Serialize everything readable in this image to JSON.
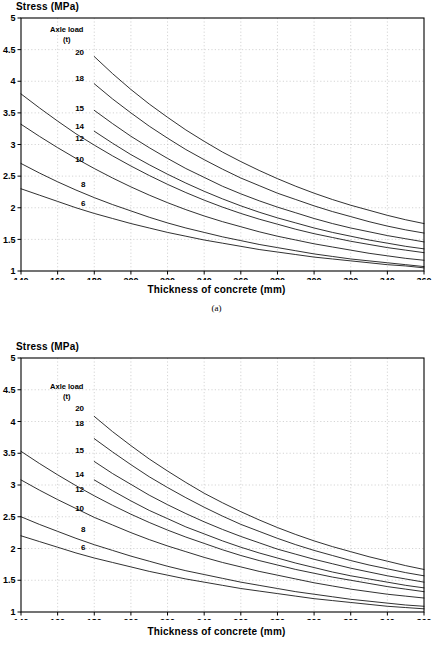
{
  "figures": [
    {
      "id": "a",
      "panel_label": "(a)",
      "y_axis_title": "Stress  (MPa)",
      "x_axis_title": "Thickness of concrete (mm)",
      "legend_title_line1": "Axle load",
      "legend_title_line2": "(t)",
      "chart_data": {
        "type": "line",
        "title": "",
        "xlabel": "Thickness of concrete (mm)",
        "ylabel": "Stress  (MPa)",
        "xlim": [
          140,
          360
        ],
        "ylim": [
          1,
          5
        ],
        "xticks": [
          140,
          160,
          180,
          200,
          220,
          240,
          260,
          280,
          300,
          320,
          340,
          360
        ],
        "yticks": [
          1,
          1.5,
          2,
          2.5,
          3,
          3.5,
          4,
          4.5,
          5
        ],
        "grid": true,
        "legend_position": "inside-upper-left",
        "legend_title": "Axle load (t)",
        "series": [
          {
            "name": "20",
            "label": "20",
            "label_x": 172,
            "label_y": 4.47,
            "x": [
              180,
              190,
              200,
              210,
              220,
              230,
              240,
              250,
              260,
              270,
              280,
              290,
              300,
              310,
              320,
              330,
              340,
              350,
              360
            ],
            "values": [
              4.39,
              4.12,
              3.87,
              3.64,
              3.43,
              3.23,
              3.05,
              2.88,
              2.73,
              2.59,
              2.46,
              2.34,
              2.23,
              2.13,
              2.04,
              1.96,
              1.88,
              1.81,
              1.75
            ]
          },
          {
            "name": "18",
            "label": "18",
            "label_x": 172,
            "label_y": 4.05,
            "x": [
              180,
              190,
              200,
              210,
              220,
              230,
              240,
              250,
              260,
              270,
              280,
              290,
              300,
              310,
              320,
              330,
              340,
              350,
              360
            ],
            "values": [
              3.96,
              3.72,
              3.5,
              3.29,
              3.1,
              2.92,
              2.76,
              2.61,
              2.47,
              2.35,
              2.23,
              2.13,
              2.03,
              1.94,
              1.86,
              1.78,
              1.71,
              1.65,
              1.6
            ]
          },
          {
            "name": "15",
            "label": "15",
            "label_x": 172,
            "label_y": 3.58,
            "x": [
              180,
              190,
              200,
              210,
              220,
              230,
              240,
              250,
              260,
              270,
              280,
              290,
              300,
              310,
              320,
              330,
              340,
              350,
              360
            ],
            "values": [
              3.54,
              3.33,
              3.13,
              2.95,
              2.78,
              2.62,
              2.48,
              2.34,
              2.22,
              2.11,
              2.01,
              1.92,
              1.83,
              1.75,
              1.68,
              1.62,
              1.56,
              1.51,
              1.46
            ]
          },
          {
            "name": "14",
            "label": "14",
            "label_x": 172,
            "label_y": 3.3,
            "x": [
              180,
              190,
              200,
              210,
              220,
              230,
              240,
              250,
              260,
              270,
              280,
              290,
              300,
              310,
              320,
              330,
              340,
              350,
              360
            ],
            "values": [
              3.21,
              3.02,
              2.84,
              2.68,
              2.53,
              2.39,
              2.26,
              2.14,
              2.03,
              1.93,
              1.84,
              1.76,
              1.68,
              1.61,
              1.55,
              1.49,
              1.44,
              1.39,
              1.35
            ]
          },
          {
            "name": "12",
            "label": "12",
            "label_x": 172,
            "label_y": 3.1,
            "x": [
              140,
              150,
              160,
              170,
              180,
              190,
              200,
              210,
              220,
              230,
              240,
              250,
              260,
              270,
              280,
              290,
              300,
              310,
              320,
              330,
              340,
              350,
              360
            ],
            "values": [
              3.8,
              3.58,
              3.37,
              3.17,
              2.99,
              2.82,
              2.66,
              2.51,
              2.37,
              2.24,
              2.12,
              2.01,
              1.91,
              1.82,
              1.74,
              1.66,
              1.59,
              1.53,
              1.47,
              1.42,
              1.37,
              1.33,
              1.29
            ]
          },
          {
            "name": "10",
            "label": "10",
            "label_x": 172,
            "label_y": 2.77,
            "x": [
              140,
              150,
              160,
              170,
              180,
              190,
              200,
              210,
              220,
              230,
              240,
              250,
              260,
              270,
              280,
              290,
              300,
              310,
              320,
              330,
              340,
              350,
              360
            ],
            "values": [
              3.32,
              3.13,
              2.95,
              2.78,
              2.62,
              2.47,
              2.33,
              2.2,
              2.08,
              1.97,
              1.87,
              1.78,
              1.7,
              1.62,
              1.55,
              1.49,
              1.43,
              1.38,
              1.33,
              1.28,
              1.24,
              1.2,
              1.17
            ]
          },
          {
            "name": "8",
            "label": "8",
            "label_x": 174,
            "label_y": 2.38,
            "x": [
              140,
              150,
              160,
              170,
              180,
              190,
              200,
              210,
              220,
              230,
              240,
              250,
              260,
              270,
              280,
              290,
              300,
              310,
              320,
              330,
              340,
              350,
              360
            ],
            "values": [
              2.7,
              2.55,
              2.41,
              2.28,
              2.16,
              2.05,
              1.95,
              1.85,
              1.76,
              1.68,
              1.61,
              1.54,
              1.48,
              1.42,
              1.37,
              1.32,
              1.27,
              1.23,
              1.19,
              1.16,
              1.13,
              1.1,
              1.07
            ]
          },
          {
            "name": "6",
            "label": "6",
            "label_x": 174,
            "label_y": 2.07,
            "x": [
              140,
              150,
              160,
              170,
              180,
              190,
              200,
              210,
              220,
              230,
              240,
              250,
              260,
              270,
              280,
              290,
              300,
              310,
              320,
              330,
              340,
              350,
              360
            ],
            "values": [
              2.3,
              2.2,
              2.1,
              2.0,
              1.91,
              1.83,
              1.75,
              1.68,
              1.61,
              1.55,
              1.49,
              1.44,
              1.39,
              1.34,
              1.3,
              1.26,
              1.22,
              1.19,
              1.16,
              1.13,
              1.1,
              1.08,
              1.05
            ]
          }
        ]
      }
    },
    {
      "id": "b",
      "panel_label": "",
      "y_axis_title": "Stress  (MPa)",
      "x_axis_title": "Thickness of concrete (mm)",
      "legend_title_line1": "Axle load",
      "legend_title_line2": "(t)",
      "chart_data": {
        "type": "line",
        "title": "",
        "xlabel": "Thickness of concrete (mm)",
        "ylabel": "Stress  (MPa)",
        "xlim": [
          140,
          360
        ],
        "ylim": [
          1,
          5
        ],
        "xticks": [
          140,
          160,
          180,
          200,
          220,
          240,
          260,
          280,
          300,
          320,
          340,
          360
        ],
        "yticks": [
          1,
          1.5,
          2,
          2.5,
          3,
          3.5,
          4,
          4.5,
          5
        ],
        "grid": true,
        "legend_position": "inside-upper-left",
        "legend_title": "Axle load (t)",
        "series": [
          {
            "name": "20",
            "label": "20",
            "label_x": 172,
            "label_y": 4.22,
            "x": [
              180,
              190,
              200,
              210,
              220,
              230,
              240,
              250,
              260,
              270,
              280,
              290,
              300,
              310,
              320,
              330,
              340,
              350,
              360
            ],
            "values": [
              4.08,
              3.84,
              3.62,
              3.41,
              3.22,
              3.04,
              2.87,
              2.72,
              2.58,
              2.45,
              2.33,
              2.22,
              2.12,
              2.03,
              1.95,
              1.87,
              1.8,
              1.73,
              1.67
            ]
          },
          {
            "name": "18",
            "label": "18",
            "label_x": 172,
            "label_y": 3.98,
            "x": [
              180,
              190,
              200,
              210,
              220,
              230,
              240,
              250,
              260,
              270,
              280,
              290,
              300,
              310,
              320,
              330,
              340,
              350,
              360
            ],
            "values": [
              3.73,
              3.52,
              3.32,
              3.13,
              2.96,
              2.8,
              2.65,
              2.51,
              2.38,
              2.27,
              2.16,
              2.06,
              1.97,
              1.89,
              1.81,
              1.74,
              1.68,
              1.62,
              1.57
            ]
          },
          {
            "name": "15",
            "label": "15",
            "label_x": 172,
            "label_y": 3.55,
            "x": [
              180,
              190,
              200,
              210,
              220,
              230,
              240,
              250,
              260,
              270,
              280,
              290,
              300,
              310,
              320,
              330,
              340,
              350,
              360
            ],
            "values": [
              3.37,
              3.18,
              3.01,
              2.84,
              2.69,
              2.55,
              2.42,
              2.3,
              2.19,
              2.09,
              1.99,
              1.91,
              1.83,
              1.76,
              1.69,
              1.63,
              1.57,
              1.52,
              1.47
            ]
          },
          {
            "name": "14",
            "label": "14",
            "label_x": 172,
            "label_y": 3.18,
            "x": [
              180,
              190,
              200,
              210,
              220,
              230,
              240,
              250,
              260,
              270,
              280,
              290,
              300,
              310,
              320,
              330,
              340,
              350,
              360
            ],
            "values": [
              3.08,
              2.91,
              2.75,
              2.6,
              2.47,
              2.34,
              2.23,
              2.12,
              2.02,
              1.93,
              1.85,
              1.77,
              1.7,
              1.63,
              1.57,
              1.52,
              1.47,
              1.42,
              1.38
            ]
          },
          {
            "name": "12",
            "label": "12",
            "label_x": 172,
            "label_y": 2.93,
            "x": [
              140,
              150,
              160,
              170,
              180,
              190,
              200,
              210,
              220,
              230,
              240,
              250,
              260,
              270,
              280,
              290,
              300,
              310,
              320,
              330,
              340,
              350,
              360
            ],
            "values": [
              3.53,
              3.34,
              3.16,
              2.99,
              2.83,
              2.68,
              2.54,
              2.41,
              2.29,
              2.18,
              2.08,
              1.98,
              1.89,
              1.81,
              1.74,
              1.67,
              1.61,
              1.55,
              1.5,
              1.45,
              1.4,
              1.36,
              1.32
            ]
          },
          {
            "name": "10",
            "label": "10",
            "label_x": 172,
            "label_y": 2.63,
            "x": [
              140,
              150,
              160,
              170,
              180,
              190,
              200,
              210,
              220,
              230,
              240,
              250,
              260,
              270,
              280,
              290,
              300,
              310,
              320,
              330,
              340,
              350,
              360
            ],
            "values": [
              3.08,
              2.92,
              2.77,
              2.63,
              2.49,
              2.37,
              2.25,
              2.14,
              2.04,
              1.95,
              1.86,
              1.78,
              1.71,
              1.64,
              1.58,
              1.52,
              1.46,
              1.41,
              1.36,
              1.32,
              1.28,
              1.25,
              1.22
            ]
          },
          {
            "name": "8",
            "label": "8",
            "label_x": 174,
            "label_y": 2.31,
            "x": [
              140,
              150,
              160,
              170,
              180,
              190,
              200,
              210,
              220,
              230,
              240,
              250,
              260,
              270,
              280,
              290,
              300,
              310,
              320,
              330,
              340,
              350,
              360
            ],
            "values": [
              2.5,
              2.38,
              2.27,
              2.16,
              2.06,
              1.97,
              1.88,
              1.8,
              1.72,
              1.65,
              1.59,
              1.53,
              1.47,
              1.42,
              1.37,
              1.32,
              1.28,
              1.24,
              1.2,
              1.17,
              1.14,
              1.11,
              1.09
            ]
          },
          {
            "name": "6",
            "label": "6",
            "label_x": 174,
            "label_y": 2.02,
            "x": [
              140,
              150,
              160,
              170,
              180,
              190,
              200,
              210,
              220,
              230,
              240,
              250,
              260,
              270,
              280,
              290,
              300,
              310,
              320,
              330,
              340,
              350,
              360
            ],
            "values": [
              2.2,
              2.11,
              2.02,
              1.93,
              1.85,
              1.78,
              1.71,
              1.64,
              1.58,
              1.52,
              1.47,
              1.42,
              1.37,
              1.33,
              1.29,
              1.25,
              1.21,
              1.18,
              1.15,
              1.12,
              1.09,
              1.07,
              1.05
            ]
          }
        ]
      }
    }
  ]
}
